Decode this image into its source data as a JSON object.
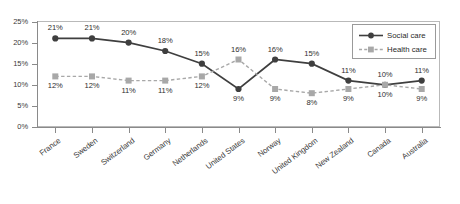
{
  "chart_data": {
    "type": "line",
    "title": "",
    "subtitle": "",
    "xlabel": "",
    "ylabel": "",
    "ylim": [
      0,
      25
    ],
    "ytick_labels": [
      "0%",
      "5%",
      "10%",
      "15%",
      "20%",
      "25%"
    ],
    "ytick_values": [
      0,
      5,
      10,
      15,
      20,
      25
    ],
    "grid": false,
    "legend_position": "top-right",
    "value_suffix": "%",
    "categories": [
      "France",
      "Sweden",
      "Switzerland",
      "Germany",
      "Netherlands",
      "United States",
      "Norway",
      "United Kingdom",
      "New Zealand",
      "Canada",
      "Australia"
    ],
    "series": [
      {
        "name": "Social care",
        "color": "#3f3f3f",
        "marker": "circle",
        "line_style": "solid",
        "values": [
          21,
          21,
          20,
          18,
          15,
          9,
          16,
          15,
          11,
          10,
          11
        ],
        "labels": [
          "21%",
          "21%",
          "20%",
          "18%",
          "15%",
          "9%",
          "16%",
          "15%",
          "11%",
          "10%",
          "11%"
        ],
        "label_positions": [
          "above",
          "above",
          "above",
          "above",
          "above",
          "below",
          "above",
          "above",
          "above",
          "above",
          "above"
        ]
      },
      {
        "name": "Health care",
        "color": "#a8a8a8",
        "marker": "square",
        "line_style": "dashed",
        "values": [
          12,
          12,
          11,
          11,
          12,
          16,
          9,
          8,
          9,
          10,
          9
        ],
        "labels": [
          "12%",
          "12%",
          "11%",
          "11%",
          "12%",
          "16%",
          "9%",
          "8%",
          "9%",
          "10%",
          "9%"
        ],
        "label_positions": [
          "below",
          "below",
          "below",
          "below",
          "below",
          "above",
          "below",
          "below",
          "below",
          "below",
          "below"
        ]
      }
    ]
  },
  "legend": {
    "items": [
      {
        "label": "Social care"
      },
      {
        "label": "Health care"
      }
    ]
  },
  "colors": {
    "social_care": "#3f3f3f",
    "health_care": "#a8a8a8",
    "axis": "#8a8a8a",
    "frame": "#b9b9b9",
    "text": "#3a3a3a",
    "background": "#ffffff"
  }
}
